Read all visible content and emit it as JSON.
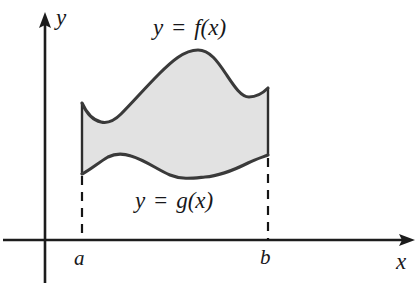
{
  "figure": {
    "kind": "area-between-curves",
    "background_color": "#ffffff",
    "axes": {
      "x_axis": {
        "label": "x",
        "axis_color": "#1c1c1c",
        "start_x": 3,
        "end_x": 415,
        "y": 240,
        "arrow": "right"
      },
      "y_axis": {
        "label": "y",
        "axis_color": "#1c1c1c",
        "x": 45,
        "start_y": 283,
        "end_y": 13,
        "arrow": "up"
      }
    },
    "ticks": [
      {
        "name": "lower-limit",
        "label": "a",
        "x": 82
      },
      {
        "name": "upper-limit",
        "label": "b",
        "x": 268
      }
    ],
    "curves": [
      {
        "name": "upper-curve",
        "label_y": "y",
        "label_eq": "=",
        "label_fn": "f(x)",
        "stroke_color": "#3a3a3a",
        "path": "M 82,103 C 86,112 92,120 101,122 C 109,124 115,120 121,114 C 133,102 145,88 159,74 C 171,62 184,50 198,50 C 210,50 218,62 226,74 C 234,86 241,97 249,97 C 257,97 263,93 268,88"
      },
      {
        "name": "lower-curve",
        "label_y": "y",
        "label_eq": "=",
        "label_fn": "g(x)",
        "stroke_color": "#3a3a3a",
        "path": "M 82,174 C 90,170 98,163 108,157 C 114,154 122,153 131,156 C 145,160 158,170 170,175 C 182,180 194,178 205,177 C 220,176 234,170 248,163 C 256,159 263,157 268,155"
      }
    ],
    "vertical_edges": [
      {
        "name": "left-edge",
        "x": 82,
        "top_y": 103,
        "bottom_y": 174
      },
      {
        "name": "right-edge",
        "x": 268,
        "top_y": 88,
        "bottom_y": 155
      }
    ],
    "dashed_drops": [
      {
        "name": "left-drop",
        "x": 82,
        "from_y": 176,
        "to_y": 240
      },
      {
        "name": "right-drop",
        "x": 268,
        "from_y": 158,
        "to_y": 240
      }
    ],
    "shaded_region": {
      "name": "area-between-curves",
      "fill_color": "#e2e2e2",
      "path": "M 82,103 C 86,112 92,120 101,122 C 109,124 115,120 121,114 C 133,102 145,88 159,74 C 171,62 184,50 198,50 C 210,50 218,62 226,74 C 234,86 241,97 249,97 C 257,97 263,93 268,88 L 268,155 C 263,157 256,159 248,163 C 234,170 220,176 205,177 C 194,178 182,180 170,175 C 158,170 145,160 131,156 C 122,153 114,154 108,157 C 98,163 90,170 82,174 Z"
    }
  }
}
